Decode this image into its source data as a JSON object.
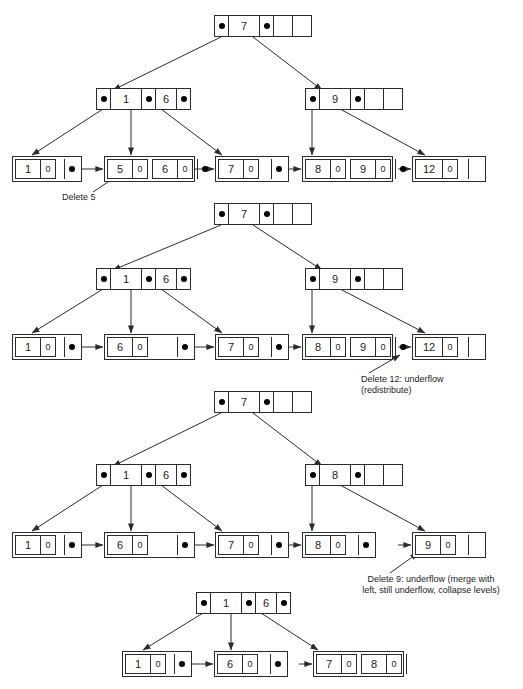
{
  "figure": {
    "stroke_color": "#2b2b2b",
    "dot_color": "#000000",
    "background": "#ffffff"
  },
  "stages": [
    {
      "id": "stage-1",
      "root": {
        "keys": [
          "7"
        ],
        "empty_slots": 1
      },
      "internal": [
        {
          "id": "internal-left-1",
          "keys": [
            "1",
            "6"
          ],
          "empty_slots": 0
        },
        {
          "id": "internal-right-1",
          "keys": [
            "9"
          ],
          "empty_slots": 1
        }
      ],
      "leaves": [
        {
          "id": "leaf-1-1",
          "entries": [
            {
              "key": "1",
              "value": "0"
            }
          ],
          "has_next": true
        },
        {
          "id": "leaf-1-2",
          "entries": [
            {
              "key": "5",
              "value": "0"
            },
            {
              "key": "6",
              "value": "0"
            }
          ],
          "has_next": true
        },
        {
          "id": "leaf-1-3",
          "entries": [
            {
              "key": "7",
              "value": "0"
            }
          ],
          "has_next": true
        },
        {
          "id": "leaf-1-4",
          "entries": [
            {
              "key": "8",
              "value": "0"
            },
            {
              "key": "9",
              "value": "0"
            }
          ],
          "has_next": true
        },
        {
          "id": "leaf-1-5",
          "entries": [
            {
              "key": "12",
              "value": "0"
            }
          ],
          "has_next": false
        }
      ],
      "annotation": "Delete 5"
    },
    {
      "id": "stage-2",
      "root": {
        "keys": [
          "7"
        ],
        "empty_slots": 1
      },
      "internal": [
        {
          "id": "internal-left-2",
          "keys": [
            "1",
            "6"
          ],
          "empty_slots": 0
        },
        {
          "id": "internal-right-2",
          "keys": [
            "9"
          ],
          "empty_slots": 1
        }
      ],
      "leaves": [
        {
          "id": "leaf-2-1",
          "entries": [
            {
              "key": "1",
              "value": "0"
            }
          ],
          "has_next": true
        },
        {
          "id": "leaf-2-2",
          "entries": [
            {
              "key": "6",
              "value": "0"
            }
          ],
          "has_next": true
        },
        {
          "id": "leaf-2-3",
          "entries": [
            {
              "key": "7",
              "value": "0"
            }
          ],
          "has_next": true
        },
        {
          "id": "leaf-2-4",
          "entries": [
            {
              "key": "8",
              "value": "0"
            },
            {
              "key": "9",
              "value": "0"
            }
          ],
          "has_next": true
        },
        {
          "id": "leaf-2-5",
          "entries": [
            {
              "key": "12",
              "value": "0"
            }
          ],
          "has_next": false
        }
      ],
      "annotation": "Delete 12: underflow\n(redistribute)"
    },
    {
      "id": "stage-3",
      "root": {
        "keys": [
          "7"
        ],
        "empty_slots": 1
      },
      "internal": [
        {
          "id": "internal-left-3",
          "keys": [
            "1",
            "6"
          ],
          "empty_slots": 0
        },
        {
          "id": "internal-right-3",
          "keys": [
            "8"
          ],
          "empty_slots": 1
        }
      ],
      "leaves": [
        {
          "id": "leaf-3-1",
          "entries": [
            {
              "key": "1",
              "value": "0"
            }
          ],
          "has_next": true
        },
        {
          "id": "leaf-3-2",
          "entries": [
            {
              "key": "6",
              "value": "0"
            }
          ],
          "has_next": true
        },
        {
          "id": "leaf-3-3",
          "entries": [
            {
              "key": "7",
              "value": "0"
            }
          ],
          "has_next": true
        },
        {
          "id": "leaf-3-4",
          "entries": [
            {
              "key": "8",
              "value": "0"
            }
          ],
          "has_next": true
        },
        {
          "id": "leaf-3-5",
          "entries": [
            {
              "key": "9",
              "value": "0"
            }
          ],
          "has_next": false
        }
      ],
      "annotation": "Delete 9: underflow (merge with\nleft, still underflow, collapse levels)"
    },
    {
      "id": "stage-4",
      "root": null,
      "internal": [
        {
          "id": "internal-root-4",
          "keys": [
            "1",
            "6"
          ],
          "empty_slots": 0
        }
      ],
      "leaves": [
        {
          "id": "leaf-4-1",
          "entries": [
            {
              "key": "1",
              "value": "0"
            }
          ],
          "has_next": true
        },
        {
          "id": "leaf-4-2",
          "entries": [
            {
              "key": "6",
              "value": "0"
            }
          ],
          "has_next": true
        },
        {
          "id": "leaf-4-3",
          "entries": [
            {
              "key": "7",
              "value": "0"
            },
            {
              "key": "8",
              "value": "0"
            }
          ],
          "has_next": false
        }
      ],
      "annotation": null
    }
  ],
  "annotations": [
    {
      "id": "annotation-delete-5",
      "text": "Delete 5"
    },
    {
      "id": "annotation-delete-12",
      "text": "Delete 12: underflow\n(redistribute)"
    },
    {
      "id": "annotation-delete-9",
      "text": "Delete 9: underflow (merge with\nleft, still underflow, collapse levels)"
    }
  ]
}
